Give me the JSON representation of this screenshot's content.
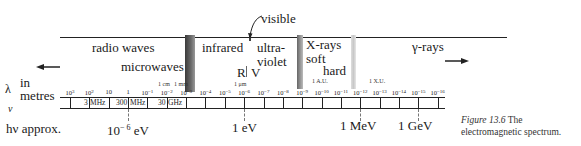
{
  "figure": {
    "caption_label": "Figure 13.6",
    "caption_text": "The",
    "caption_line2": "electromagnetic spectrum."
  },
  "bands": {
    "radio": "radio waves",
    "microwaves": "microwaves",
    "infrared": "infrared",
    "visible": "visible",
    "ultraviolet_1": "ultra-",
    "ultraviolet_2": "violet",
    "xrays": "X-rays",
    "soft": "soft",
    "hard": "hard",
    "gamma": "γ-rays",
    "red": "R",
    "violet": "V"
  },
  "annotations": {
    "cm": "1 cm",
    "mm": "1 mm",
    "um": "1 μm",
    "au": "1 A.U.",
    "xu": "1 X.U."
  },
  "axes": {
    "lambda_symbol": "λ",
    "lambda_unit_1": "in",
    "lambda_unit_2": "metres",
    "nu_symbol": "ν",
    "energy_label": "hν approx."
  },
  "chart_data": {
    "type": "table",
    "title": "The electromagnetic spectrum",
    "wavelength_ticks_m": [
      "10^3",
      "10^2",
      "10",
      "1",
      "10^-1",
      "10^-2",
      "10^-3",
      "10^-4",
      "10^-5",
      "10^-6",
      "10^-7",
      "10^-8",
      "10^-9",
      "10^-10",
      "10^-11",
      "10^-12",
      "10^-13",
      "10^-14",
      "10^-15",
      "10^-16"
    ],
    "frequency_labels": [
      {
        "value": "3",
        "unit": "MHz",
        "at_wavelength": "10^2"
      },
      {
        "value": "300",
        "unit": "MHz",
        "at_wavelength": "1"
      },
      {
        "value": "30",
        "unit": "GHz",
        "at_wavelength": "10^-2"
      }
    ],
    "photon_energy_markers": [
      {
        "label": "10^-6 eV",
        "at_wavelength": "1"
      },
      {
        "label": "1 eV",
        "at_wavelength": "10^-6"
      },
      {
        "label": "1 MeV",
        "at_wavelength": "10^-12"
      },
      {
        "label": "1 GeV",
        "at_wavelength": "10^-15"
      }
    ],
    "regions": [
      "radio waves",
      "microwaves",
      "infrared",
      "visible",
      "ultraviolet",
      "X-rays (soft, hard)",
      "γ-rays"
    ],
    "length_markers": [
      "1 cm",
      "1 mm",
      "1 μm",
      "1 A.U.",
      "1 X.U."
    ]
  },
  "ticks": [
    {
      "base": "10",
      "exp": "3"
    },
    {
      "base": "10",
      "exp": "2"
    },
    {
      "base": "10",
      "exp": ""
    },
    {
      "base": "1",
      "exp": ""
    },
    {
      "base": "10",
      "exp": "-1"
    },
    {
      "base": "10",
      "exp": "-2"
    },
    {
      "base": "10",
      "exp": "-3"
    },
    {
      "base": "10",
      "exp": "-4"
    },
    {
      "base": "10",
      "exp": "-5"
    },
    {
      "base": "10",
      "exp": "-6"
    },
    {
      "base": "10",
      "exp": "-7"
    },
    {
      "base": "10",
      "exp": "-8"
    },
    {
      "base": "10",
      "exp": "-9"
    },
    {
      "base": "10",
      "exp": "-10"
    },
    {
      "base": "10",
      "exp": "-11"
    },
    {
      "base": "10",
      "exp": "-12"
    },
    {
      "base": "10",
      "exp": "-13"
    },
    {
      "base": "10",
      "exp": "-14"
    },
    {
      "base": "10",
      "exp": "-15"
    },
    {
      "base": "10",
      "exp": "-16"
    }
  ],
  "freq": {
    "f1_val": "3",
    "f1_unit": "MHz",
    "f2_val": "300",
    "f2_unit": "MHz",
    "f3_val": "30",
    "f3_unit": "GHz"
  },
  "energy": {
    "e1_base": "10",
    "e1_exp": "− 6",
    "e1_unit": "eV",
    "e2": "1 eV",
    "e3": "1 MeV",
    "e4": "1 GeV"
  }
}
